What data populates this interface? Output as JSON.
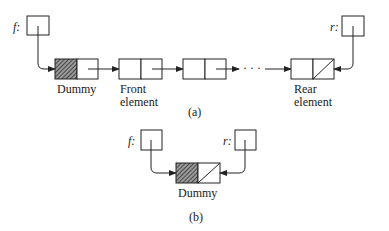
{
  "diagram": {
    "part_a": {
      "caption": "(a)",
      "front_pointer": {
        "name": "f:"
      },
      "rear_pointer": {
        "name": "r:"
      },
      "nodes": [
        {
          "label_lines": [
            "Dummy"
          ],
          "data_hatched": true,
          "next_null": false
        },
        {
          "label_lines": [
            "Front",
            "element"
          ],
          "data_hatched": false,
          "next_null": false
        },
        {
          "label_lines": [],
          "data_hatched": false,
          "next_null": false
        },
        {
          "label_lines": [
            "Rear",
            "element"
          ],
          "data_hatched": false,
          "next_null": true
        }
      ],
      "ellipsis": "· · ·"
    },
    "part_b": {
      "caption": "(b)",
      "front_pointer": {
        "name": "f:"
      },
      "rear_pointer": {
        "name": "r:"
      },
      "node": {
        "label": "Dummy",
        "data_hatched": true,
        "next_null": true
      }
    }
  },
  "colors": {
    "line": "#222222",
    "hatch": "#555555",
    "background": "#ffffff"
  }
}
